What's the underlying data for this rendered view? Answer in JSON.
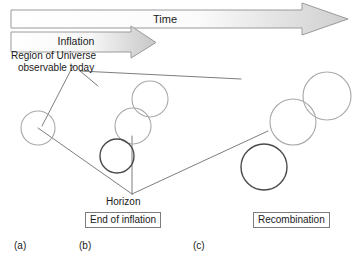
{
  "diagram": {
    "title_arrows": {
      "time": {
        "label": "Time",
        "body_fill_start": "#ffffff",
        "body_fill_end": "#d0d0d0",
        "stroke": "#9a9a9a"
      },
      "inflation": {
        "label": "Inflation",
        "body_fill_start": "#ffffff",
        "body_fill_end": "#c9c9c9",
        "stroke": "#9a9a9a"
      }
    },
    "annotations": {
      "region_line1": "Region of Universe",
      "region_line2": "observable today",
      "horizon": "Horizon"
    },
    "stage_boxes": [
      {
        "name": "end-of-inflation",
        "label": "End of inflation"
      },
      {
        "name": "recombination",
        "label": "Recombination"
      }
    ],
    "panel_labels": [
      {
        "name": "a",
        "label": "(a)"
      },
      {
        "name": "b",
        "label": "(b)"
      },
      {
        "name": "c",
        "label": "(c)"
      }
    ],
    "colors": {
      "light_circle_stroke": "#a8a8a8",
      "dark_circle_stroke": "#4a4a4a",
      "guide_line": "#6e6e6e",
      "box_border": "#7d7d7d",
      "text": "#1a1a1a",
      "background": "#ffffff"
    },
    "circles": [
      {
        "name": "circle-a-1",
        "cx": 38,
        "cy": 128,
        "r": 17,
        "tone": "light"
      },
      {
        "name": "circle-b-top",
        "cx": 150,
        "cy": 99,
        "r": 18,
        "tone": "light"
      },
      {
        "name": "circle-b-mid",
        "cx": 133,
        "cy": 126,
        "r": 18,
        "tone": "light"
      },
      {
        "name": "circle-b-dark",
        "cx": 117,
        "cy": 156,
        "r": 17,
        "tone": "dark"
      },
      {
        "name": "circle-c-top",
        "cx": 327,
        "cy": 96,
        "r": 24,
        "tone": "light"
      },
      {
        "name": "circle-c-mid",
        "cx": 293,
        "cy": 122,
        "r": 23,
        "tone": "light"
      },
      {
        "name": "circle-c-dark",
        "cx": 264,
        "cy": 167,
        "r": 23,
        "tone": "dark"
      }
    ],
    "guide_lines": [
      {
        "name": "region-leader",
        "x1": 73,
        "y1": 66,
        "x2": 42,
        "y2": 126
      },
      {
        "name": "region-tick",
        "x1": 80,
        "y1": 71,
        "x2": 98,
        "y2": 86
      },
      {
        "name": "upper-cone-line",
        "x1": 80,
        "y1": 71,
        "x2": 241,
        "y2": 79
      },
      {
        "name": "cone-left-edge",
        "x1": 38,
        "y1": 128,
        "x2": 132,
        "y2": 194
      },
      {
        "name": "cone-right-edge",
        "x1": 132,
        "y1": 194,
        "x2": 268,
        "y2": 131
      },
      {
        "name": "horizon-vertical",
        "x1": 132,
        "y1": 194,
        "x2": 132,
        "y2": 136
      }
    ]
  }
}
